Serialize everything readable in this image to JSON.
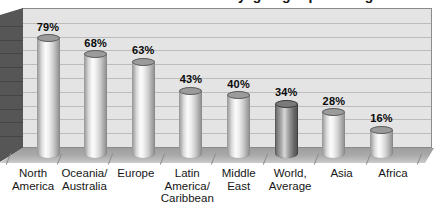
{
  "clipped_title": "by geographic region",
  "chart_data": {
    "type": "bar",
    "style": "3d-cylinder",
    "title": "",
    "xlabel": "",
    "ylabel": "",
    "categories": [
      "North America",
      "Oceania/ Australia",
      "Europe",
      "Latin America/ Caribbean",
      "Middle East",
      "World, Average",
      "Asia",
      "Africa"
    ],
    "category_label_lines": [
      [
        "North",
        "America"
      ],
      [
        "Oceania/",
        "Australia"
      ],
      [
        "Europe"
      ],
      [
        "Latin",
        "America/",
        "Caribbean"
      ],
      [
        "Middle",
        "East"
      ],
      [
        "World,",
        "Average"
      ],
      [
        "Asia"
      ],
      [
        "Africa"
      ]
    ],
    "values": [
      79,
      68,
      63,
      43,
      40,
      34,
      28,
      16
    ],
    "data_labels": [
      "79%",
      "68%",
      "63%",
      "43%",
      "40%",
      "34%",
      "28%",
      "16%"
    ],
    "highlighted_series_index": 5,
    "ylim": [
      0,
      100
    ],
    "gridline_step_pct": 10,
    "grid": "horizontal gridlines on back wall",
    "legend": "none",
    "colors": {
      "plot_wall": "#e4e4e4",
      "gridline": "#bcbcbc",
      "wall_border": "#8b8b8b",
      "side_wall": "#565656",
      "floor": "#a9a9a9",
      "bar_highlight_fill": "#fbfbfb",
      "bar_shade_fill": "#959595",
      "highlighted_bar_fill": "#7a7a7a",
      "data_label_color": "#0a0a0a",
      "category_label_color": "#161616"
    }
  }
}
